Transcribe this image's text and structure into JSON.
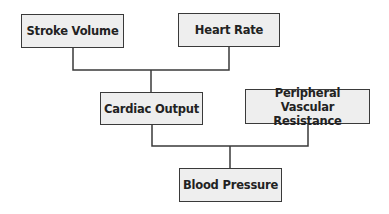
{
  "diagram": {
    "nodes": [
      {
        "id": "stroke_volume",
        "label": "Stroke Volume"
      },
      {
        "id": "heart_rate",
        "label": "Heart Rate"
      },
      {
        "id": "cardiac_output",
        "label": "Cardiac Output"
      },
      {
        "id": "pvr",
        "label": "Peripheral Vascular Resistance"
      },
      {
        "id": "blood_pressure",
        "label": "Blood Pressure"
      }
    ],
    "edges": [
      {
        "from": "stroke_volume",
        "to": "cardiac_output"
      },
      {
        "from": "heart_rate",
        "to": "cardiac_output"
      },
      {
        "from": "cardiac_output",
        "to": "blood_pressure"
      },
      {
        "from": "pvr",
        "to": "blood_pressure"
      }
    ],
    "colors": {
      "box_fill": "#eeeeee",
      "border": "#3a3a3a",
      "text": "#222222",
      "background": "#ffffff"
    }
  }
}
